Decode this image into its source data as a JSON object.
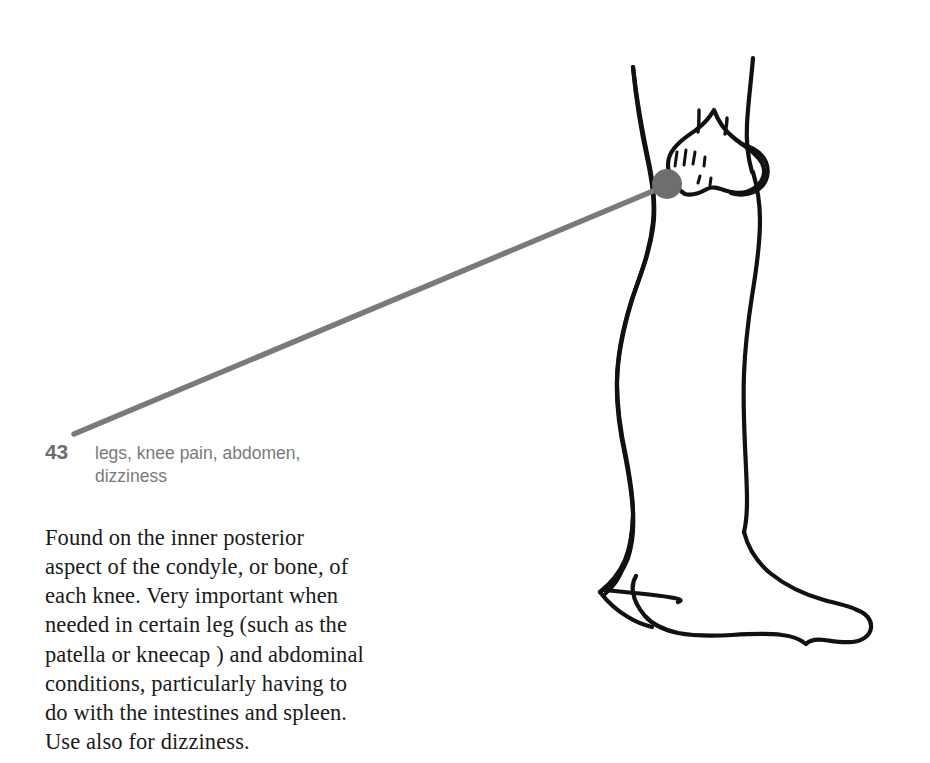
{
  "page": {
    "background_color": "#ffffff",
    "width": 930,
    "height": 763
  },
  "caption": {
    "number": "43",
    "keywords_line_1": "legs, knee pain, abdomen,",
    "keywords_line_2": "dizziness",
    "number_color": "#6e6e6e",
    "keywords_color": "#7a7a7a"
  },
  "body": {
    "lines": [
      "Found on the inner posterior",
      "aspect of the condyle, or bone, of",
      "each knee. Very important when",
      "needed in certain leg (such as the",
      "patella or kneecap ) and abdominal",
      "conditions, particularly having to",
      "do with the intestines and spleen.",
      "Use also for dizziness."
    ],
    "text_color": "#1a1a1a"
  },
  "illustration": {
    "subject": "side view of a human leg from thigh to foot",
    "outline_color": "#111111",
    "acupressure_point_color": "#6e6e6e",
    "leader_line_color": "#7a7a7a",
    "point_label": "43",
    "point_location": "inner posterior aspect of the knee condyle"
  }
}
